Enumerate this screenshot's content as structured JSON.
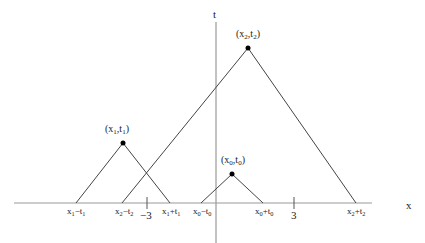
{
  "diagram": {
    "axes": {
      "x_label": "x",
      "t_label": "t",
      "ticks": [
        {
          "label": "−3",
          "value": -3
        },
        {
          "label": "3",
          "value": 3
        }
      ]
    },
    "points": [
      {
        "id": "p1",
        "label": "(x1,t1)",
        "base_left": "x1−t1",
        "base_right": "x1+t1"
      },
      {
        "id": "p2",
        "label": "(x2,t2)",
        "base_left": "x2−t2",
        "base_right": "x2+t2"
      },
      {
        "id": "p0",
        "label": "(x0,t0)",
        "base_left": "x0−t0",
        "base_right": "x0+t0"
      }
    ],
    "colors": {
      "line": "#444444",
      "axis": "#888888",
      "point": "#000000"
    }
  }
}
